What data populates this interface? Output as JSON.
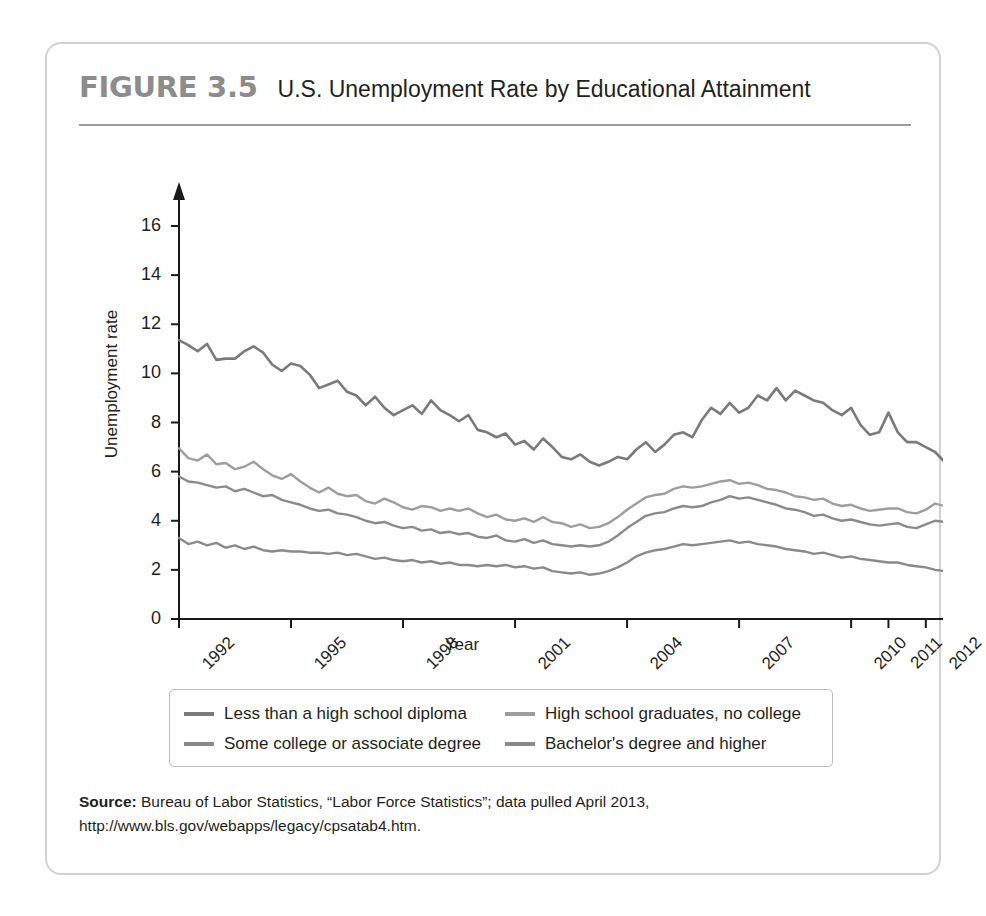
{
  "figure": {
    "number": "FIGURE 3.5",
    "title": "U.S. Unemployment Rate by Educational Attainment"
  },
  "source": {
    "label": "Source:",
    "text": " Bureau of Labor Statistics, “Labor Force Statistics”; data pulled April 2013, http://www.bls.gov/webapps/legacy/cpsatab4.htm."
  },
  "legend": [
    {
      "label": "Less than a high school diploma",
      "color": "#7a7a7a"
    },
    {
      "label": "High school graduates, no college",
      "color": "#9d9d9d"
    },
    {
      "label": "Some college or associate degree",
      "color": "#8a8a8a"
    },
    {
      "label": "Bachelor's degree and higher",
      "color": "#8a8a8a"
    }
  ],
  "chart_data": {
    "type": "line",
    "title": "U.S. Unemployment Rate by Educational Attainment",
    "xlabel": "Year",
    "ylabel": "Unemployment rate",
    "xlim": [
      1992,
      2012.3
    ],
    "ylim": [
      0,
      17
    ],
    "yticks": [
      0,
      2,
      4,
      6,
      8,
      10,
      12,
      14,
      16
    ],
    "xticks": [
      1992,
      1995,
      1998,
      2001,
      2004,
      2007,
      2010,
      2011,
      2012
    ],
    "grid": false,
    "legend_position": "bottom",
    "x_step": 0.25,
    "series": [
      {
        "name": "Less than a high school diploma",
        "color": "#7a7a7a",
        "values": [
          11.35,
          11.15,
          10.9,
          11.2,
          10.55,
          10.6,
          10.6,
          10.9,
          11.1,
          10.85,
          10.35,
          10.1,
          10.4,
          10.3,
          9.95,
          9.4,
          9.55,
          9.7,
          9.25,
          9.1,
          8.7,
          9.05,
          8.6,
          8.3,
          8.5,
          8.7,
          8.35,
          8.9,
          8.5,
          8.3,
          8.05,
          8.3,
          7.7,
          7.6,
          7.4,
          7.55,
          7.1,
          7.25,
          6.9,
          7.35,
          7.0,
          6.6,
          6.5,
          6.7,
          6.4,
          6.25,
          6.4,
          6.6,
          6.5,
          6.9,
          7.2,
          6.8,
          7.1,
          7.5,
          7.6,
          7.4,
          8.1,
          8.6,
          8.35,
          8.8,
          8.4,
          8.6,
          9.1,
          8.9,
          9.4,
          8.9,
          9.3,
          9.1,
          8.9,
          8.8,
          8.5,
          8.3,
          8.6,
          7.9,
          7.5,
          7.6,
          8.4,
          7.6,
          7.2,
          7.2,
          7.0,
          6.8,
          6.4,
          6.6,
          6.3,
          5.7,
          6.2,
          6.6,
          6.4,
          6.8,
          7.4,
          7.2,
          7.8,
          8.8,
          9.9,
          10.9,
          12.2,
          13.0,
          14.0,
          14.8,
          15.4,
          15.6,
          15.7,
          15.8,
          15.3,
          14.1,
          15.7,
          15.0,
          14.2,
          14.0,
          13.6,
          13.2,
          12.9,
          12.4
        ]
      },
      {
        "name": "High school graduates, no college",
        "color": "#9d9d9d",
        "values": [
          6.95,
          6.55,
          6.45,
          6.7,
          6.3,
          6.35,
          6.1,
          6.2,
          6.4,
          6.1,
          5.85,
          5.7,
          5.9,
          5.6,
          5.35,
          5.15,
          5.35,
          5.1,
          5.0,
          5.05,
          4.8,
          4.7,
          4.9,
          4.75,
          4.55,
          4.45,
          4.6,
          4.55,
          4.4,
          4.5,
          4.4,
          4.5,
          4.3,
          4.15,
          4.25,
          4.05,
          4.0,
          4.1,
          3.95,
          4.15,
          3.95,
          3.9,
          3.75,
          3.85,
          3.7,
          3.75,
          3.9,
          4.15,
          4.45,
          4.7,
          4.95,
          5.05,
          5.1,
          5.3,
          5.4,
          5.35,
          5.4,
          5.5,
          5.6,
          5.65,
          5.5,
          5.55,
          5.45,
          5.3,
          5.25,
          5.15,
          5.0,
          4.95,
          4.85,
          4.9,
          4.7,
          4.6,
          4.65,
          4.5,
          4.4,
          4.45,
          4.5,
          4.5,
          4.35,
          4.3,
          4.45,
          4.7,
          4.6,
          4.75,
          4.9,
          5.1,
          5.4,
          5.9,
          6.5,
          7.2,
          8.1,
          8.9,
          9.4,
          9.7,
          9.8,
          10.0,
          10.1,
          9.8,
          10.1,
          9.9,
          10.3,
          11.3,
          10.0,
          9.9,
          9.7,
          9.5,
          9.3,
          9.2,
          8.8,
          8.6,
          8.4,
          8.3
        ]
      },
      {
        "name": "Some college or associate degree",
        "color": "#8a8a8a",
        "values": [
          5.8,
          5.6,
          5.55,
          5.45,
          5.35,
          5.4,
          5.2,
          5.3,
          5.15,
          5.0,
          5.05,
          4.85,
          4.75,
          4.65,
          4.5,
          4.4,
          4.45,
          4.3,
          4.25,
          4.15,
          4.0,
          3.9,
          3.95,
          3.8,
          3.7,
          3.75,
          3.6,
          3.65,
          3.5,
          3.55,
          3.45,
          3.5,
          3.35,
          3.3,
          3.4,
          3.2,
          3.15,
          3.25,
          3.1,
          3.2,
          3.05,
          3.0,
          2.95,
          3.0,
          2.95,
          3.0,
          3.15,
          3.4,
          3.7,
          3.95,
          4.2,
          4.3,
          4.35,
          4.5,
          4.6,
          4.55,
          4.6,
          4.75,
          4.85,
          5.0,
          4.9,
          4.95,
          4.85,
          4.75,
          4.65,
          4.5,
          4.45,
          4.35,
          4.2,
          4.25,
          4.1,
          4.0,
          4.05,
          3.95,
          3.85,
          3.8,
          3.85,
          3.9,
          3.75,
          3.7,
          3.85,
          4.0,
          3.95,
          4.1,
          4.25,
          4.4,
          4.7,
          5.1,
          5.6,
          6.2,
          6.9,
          7.5,
          7.9,
          8.2,
          8.3,
          8.5,
          8.5,
          8.3,
          8.4,
          8.2,
          8.5,
          9.6,
          8.2,
          8.3,
          8.1,
          7.9,
          7.8,
          7.6,
          7.5,
          7.4,
          7.3,
          7.2
        ]
      },
      {
        "name": "Bachelor's degree and higher",
        "color": "#8a8a8a",
        "values": [
          3.3,
          3.05,
          3.15,
          3.0,
          3.1,
          2.9,
          3.0,
          2.85,
          2.95,
          2.8,
          2.75,
          2.8,
          2.75,
          2.75,
          2.7,
          2.7,
          2.65,
          2.7,
          2.6,
          2.65,
          2.55,
          2.45,
          2.5,
          2.4,
          2.35,
          2.4,
          2.3,
          2.35,
          2.25,
          2.3,
          2.2,
          2.2,
          2.15,
          2.2,
          2.15,
          2.2,
          2.1,
          2.15,
          2.05,
          2.1,
          1.95,
          1.9,
          1.85,
          1.9,
          1.8,
          1.85,
          1.95,
          2.1,
          2.3,
          2.55,
          2.7,
          2.8,
          2.85,
          2.95,
          3.05,
          3.0,
          3.05,
          3.1,
          3.15,
          3.2,
          3.1,
          3.15,
          3.05,
          3.0,
          2.95,
          2.85,
          2.8,
          2.75,
          2.65,
          2.7,
          2.6,
          2.5,
          2.55,
          2.45,
          2.4,
          2.35,
          2.3,
          2.3,
          2.2,
          2.15,
          2.1,
          2.0,
          1.95,
          2.0,
          2.05,
          2.15,
          2.3,
          2.5,
          2.8,
          3.1,
          3.4,
          3.7,
          4.0,
          4.2,
          4.4,
          4.6,
          4.7,
          4.6,
          4.7,
          4.65,
          4.75,
          4.9,
          4.2,
          4.2,
          4.2,
          4.15,
          4.1,
          4.1,
          4.05,
          4.0,
          4.0,
          4.0
        ]
      }
    ]
  }
}
